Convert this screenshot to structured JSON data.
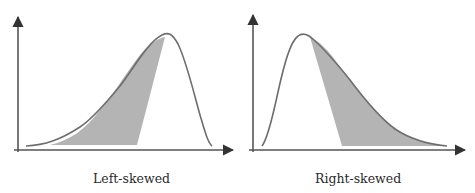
{
  "figure": {
    "panels": [
      {
        "id": "left",
        "caption": "Left-skewed",
        "skew": "negative"
      },
      {
        "id": "right",
        "caption": "Right-skewed",
        "skew": "positive"
      }
    ]
  },
  "colors": {
    "curve": "#6e6e6e",
    "axis": "#555555",
    "shade": "#b4b4b4",
    "text": "#2a2a2a"
  }
}
